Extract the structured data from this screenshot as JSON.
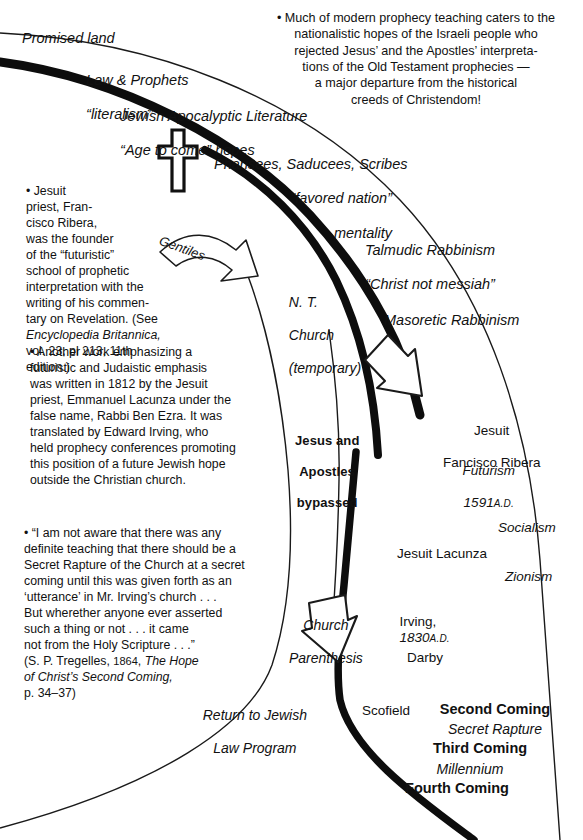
{
  "meta": {
    "ink_color": "#111111",
    "background": "#ffffff"
  },
  "diagram": {
    "left_curve_labels": [
      {
        "id": "promised-land",
        "text": "Promised land"
      },
      {
        "id": "law-and-prophets",
        "line1": "Law & Prophets",
        "line2": "“literalism”"
      },
      {
        "id": "jewish-apocalyptic",
        "line1": "Jewish Apocalyptic Literature",
        "line2": "“Age to come” hopes"
      }
    ],
    "cross_icon": "latin-cross-icon",
    "branch_labels": [
      {
        "id": "pharisees",
        "line1": "Pharisees, Saducees, Scribes",
        "line2": "“favored nation”",
        "line3": "mentality"
      },
      {
        "id": "talmudic",
        "line1": "Talmudic Rabbinism",
        "line2": "“Christ not messiah”"
      },
      {
        "id": "masoretic",
        "text": "Masoretic Rabbinism"
      },
      {
        "id": "nt-church",
        "line1": "N. T.",
        "line2": "Church",
        "line3": "(temporary)"
      },
      {
        "id": "gentiles-arrow",
        "text": "Gentiles"
      },
      {
        "id": "jesus-apostles-bypassed",
        "line1": "Jesus and",
        "line2": "Apostles",
        "line3": "bypassed"
      },
      {
        "id": "church-parenthesis",
        "line1": "Church",
        "line2": "Parenthesis"
      },
      {
        "id": "return-jewish-law",
        "line1": "Return to Jewish",
        "line2": "Law Program"
      }
    ],
    "timeline_labels": [
      {
        "id": "jesuit-ribera",
        "line1": "Jesuit",
        "line2": "Fancisco Ribera"
      },
      {
        "id": "futurism",
        "line1": "Futurism",
        "line2": "1591",
        "suffix": "A.D."
      },
      {
        "id": "socialism",
        "text": "Socialism"
      },
      {
        "id": "jesuit-lacunza",
        "text": "Jesuit Lacunza"
      },
      {
        "id": "zionism",
        "text": "Zionism"
      },
      {
        "id": "irving",
        "text": "Irving,",
        "year": "1830",
        "suffix": "A.D."
      },
      {
        "id": "darby",
        "text": "Darby"
      },
      {
        "id": "scofield",
        "text": "Scofield"
      }
    ],
    "comings": [
      {
        "id": "second-coming",
        "text": "Second Coming",
        "style": "bold"
      },
      {
        "id": "secret-rapture",
        "text": "Secret Rapture",
        "style": "italic"
      },
      {
        "id": "third-coming",
        "text": "Third Coming",
        "style": "bold"
      },
      {
        "id": "millennium",
        "text": "Millennium",
        "style": "italic"
      },
      {
        "id": "fourth-coming",
        "text": "Fourth Coming",
        "style": "bold"
      }
    ]
  },
  "notes": {
    "top_right": "• Much of modern prophecy teaching caters to the\nnationalistic hopes of the Israeli people who\nrejected Jesus’ and the Apostles’ interpreta-\ntions of the Old Testament prophecies —\na major departure from the historical\ncreeds of Christendom!",
    "ribera": {
      "body": "• Jesuit\npriest, Fran-\ncisco Ribera,\nwas the founder\nof the “futuristic”\nschool of prophetic\ninterpretation with the\nwriting of his commen-\ntary on Revelation. (See",
      "source_italic": "Encyclopedia Britannica,",
      "source_tail": "vol. 23, pl 213, 11th edition.)"
    },
    "lacunza": "• Another work emphasizing a\nfuturistic and Judaistic emphasis\nwas written in 1812 by the Jesuit\npriest, Emmanuel Lacunza under the\nfalse name, Rabbi Ben Ezra. It was\ntranslated by Edward Irving, who\nheld prophecy conferences promoting\nthis position of a future Jewish hope\noutside the Christian church.",
    "tregelles": {
      "quote": "• “I am not aware that there was any\ndefinite teaching that there should be a\nSecret Rapture of the Church at a secret\ncoming until this was given forth as an\n‘utterance’ in Mr. Irving’s church . . .\nBut wherether anyone ever asserted\nsuch a thing or not . . . it came\nnot from the Holy Scripture . . .”",
      "cite_pre": "(S. P. Tregelles, ",
      "cite_year": "1864",
      "cite_mid": ", ",
      "cite_title": "The Hope\nof Christ’s Second Coming,",
      "cite_page": "p. 34–37)"
    }
  }
}
